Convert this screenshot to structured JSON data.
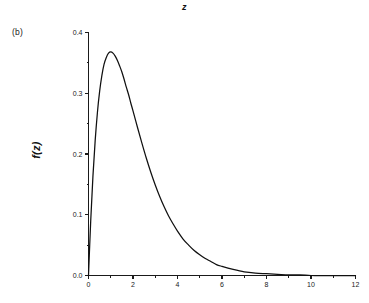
{
  "figure": {
    "panel_label": "(b)",
    "background_color": "#ffffff",
    "line_color": "#101010"
  },
  "chart_data": {
    "type": "line",
    "title": "z",
    "xlabel": "z",
    "ylabel": "f(z)",
    "xlim": [
      0,
      12
    ],
    "ylim": [
      0.0,
      0.4
    ],
    "grid": false,
    "legend": null,
    "x_major_ticks": [
      0,
      2,
      4,
      6,
      8,
      10,
      12
    ],
    "x_major_tick_labels": [
      "0",
      "2",
      "4",
      "6",
      "8",
      "10",
      "12"
    ],
    "x_minor_ticks": [
      1,
      3,
      5,
      7,
      9,
      11
    ],
    "y_major_ticks": [
      0.0,
      0.1,
      0.2,
      0.3,
      0.4
    ],
    "y_major_tick_labels": [
      "0.0",
      "0.1",
      "0.2",
      "0.3",
      "0.4"
    ],
    "y_minor_ticks": [
      0.05,
      0.15,
      0.25,
      0.35
    ],
    "series": [
      {
        "name": "f(z)",
        "x": [
          0.0,
          0.1,
          0.2,
          0.3,
          0.4,
          0.5,
          0.6,
          0.7,
          0.8,
          0.9,
          1.0,
          1.1,
          1.2,
          1.3,
          1.4,
          1.5,
          1.6,
          1.7,
          1.8,
          1.9,
          2.0,
          2.2,
          2.4,
          2.6,
          2.8,
          3.0,
          3.2,
          3.4,
          3.6,
          3.8,
          4.0,
          4.25,
          4.5,
          4.75,
          5.0,
          5.25,
          5.5,
          5.75,
          6.0,
          6.5,
          7.0,
          7.5,
          8.0,
          8.5,
          9.0,
          9.5,
          10.0,
          10.5,
          11.0,
          11.5,
          12.0
        ],
        "y": [
          0.0,
          0.09,
          0.164,
          0.222,
          0.268,
          0.303,
          0.329,
          0.348,
          0.359,
          0.366,
          0.368,
          0.366,
          0.361,
          0.354,
          0.345,
          0.335,
          0.323,
          0.31,
          0.298,
          0.284,
          0.271,
          0.244,
          0.218,
          0.193,
          0.17,
          0.149,
          0.13,
          0.113,
          0.098,
          0.085,
          0.073,
          0.06,
          0.05,
          0.041,
          0.034,
          0.028,
          0.023,
          0.018,
          0.015,
          0.01,
          0.006,
          0.004,
          0.003,
          0.002,
          0.001,
          0.001,
          0.0,
          0.0,
          0.0,
          0.0,
          0.0
        ],
        "peak_x": 1.0,
        "peak_y": 0.368
      }
    ]
  }
}
